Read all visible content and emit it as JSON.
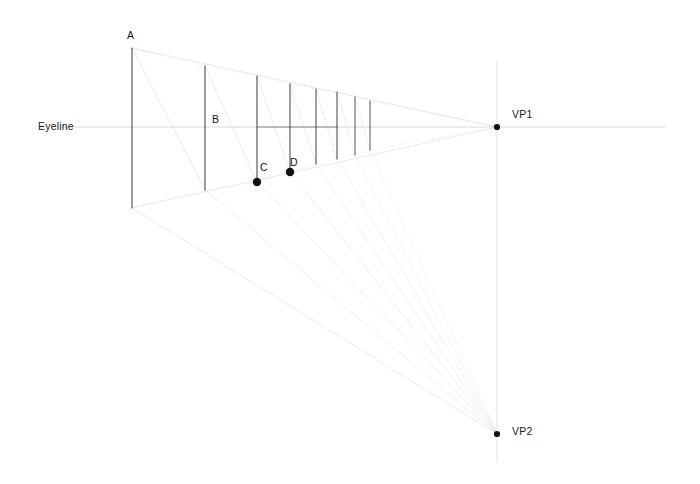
{
  "drawing": {
    "title": "Two-point perspective construction",
    "background_color": "#ffffff",
    "canvas": {
      "width": 700,
      "height": 484
    },
    "labels": {
      "eyeline": "Eyeline",
      "a": "A",
      "b": "B",
      "c": "C",
      "d": "D",
      "vp1": "VP1",
      "vp2": "VP2"
    },
    "colors": {
      "stroke_strong": "#3a3a3c",
      "stroke_dark": "#222225",
      "stroke_faint": "#c9c9cc",
      "stroke_very_faint": "#e0e0e3",
      "point_fill": "#101012",
      "text": "#16181a"
    },
    "label_positions": {
      "eyeline": {
        "x": 38,
        "y": 121
      },
      "a": {
        "x": 127,
        "y": 30
      },
      "b": {
        "x": 212,
        "y": 114
      },
      "c": {
        "x": 260,
        "y": 162
      },
      "d": {
        "x": 290,
        "y": 157
      },
      "vp1": {
        "x": 512,
        "y": 109
      },
      "vp2": {
        "x": 512,
        "y": 426
      }
    },
    "eyeline": {
      "x1": 62,
      "y1": 127,
      "x2": 665,
      "y2": 127
    },
    "vanishing_points": [
      {
        "name": "VP1",
        "x": 497,
        "y": 127,
        "radius": 3.1
      },
      {
        "name": "VP2",
        "x": 497,
        "y": 434,
        "radius": 3.1
      }
    ],
    "vertical_trace": {
      "x": 497,
      "y1": 60,
      "y2": 462
    },
    "verticals": [
      {
        "name": "A",
        "x": 132,
        "top": 48,
        "bottom": 208,
        "weight": 1.05
      },
      {
        "name": "B",
        "x": 205,
        "top": 66,
        "bottom": 190,
        "weight": 1.05
      },
      {
        "name": "C",
        "x": 257,
        "top": 76,
        "bottom": 182,
        "weight": 1.05
      },
      {
        "name": "D",
        "x": 290,
        "top": 84,
        "bottom": 172,
        "weight": 1.0
      },
      {
        "name": "E",
        "x": 316,
        "top": 89,
        "bottom": 164,
        "weight": 1.0
      },
      {
        "name": "F",
        "x": 337,
        "top": 92,
        "bottom": 159,
        "weight": 1.0
      },
      {
        "name": "G",
        "x": 355,
        "top": 97,
        "bottom": 155,
        "weight": 0.9
      },
      {
        "name": "H",
        "x": 370,
        "top": 101,
        "bottom": 150,
        "weight": 0.9
      }
    ],
    "ground_points": [
      {
        "name": "C",
        "x": 257,
        "y": 182,
        "radius": 4.2
      },
      {
        "name": "D",
        "x": 290,
        "y": 172,
        "radius": 4.2
      }
    ],
    "convergence_lines_vp1": [
      {
        "from_x": 132,
        "from_y": 48,
        "to_x": 497,
        "to_y": 127,
        "opacity": 0.55
      },
      {
        "from_x": 132,
        "from_y": 208,
        "to_x": 497,
        "to_y": 127,
        "opacity": 0.5
      }
    ],
    "convergence_lines_vp2": [
      {
        "from_x": 132,
        "from_y": 208,
        "to_x": 497,
        "to_y": 434,
        "opacity": 0.5
      },
      {
        "from_x": 205,
        "from_y": 190,
        "to_x": 497,
        "to_y": 434,
        "opacity": 0.42
      },
      {
        "from_x": 257,
        "from_y": 182,
        "to_x": 497,
        "to_y": 434,
        "opacity": 0.42
      },
      {
        "from_x": 290,
        "from_y": 172,
        "to_x": 497,
        "to_y": 434,
        "opacity": 0.4
      },
      {
        "from_x": 316,
        "from_y": 164,
        "to_x": 497,
        "to_y": 434,
        "opacity": 0.36
      },
      {
        "from_x": 337,
        "from_y": 159,
        "to_x": 497,
        "to_y": 434,
        "opacity": 0.34
      },
      {
        "from_x": 355,
        "from_y": 155,
        "to_x": 497,
        "to_y": 434,
        "opacity": 0.3
      },
      {
        "from_x": 370,
        "from_y": 150,
        "to_x": 497,
        "to_y": 434,
        "opacity": 0.28
      }
    ],
    "diagonal_segments": [
      {
        "x1": 132,
        "y1": 48,
        "x2": 205,
        "y2": 190,
        "opacity": 0.5
      },
      {
        "x1": 205,
        "y1": 66,
        "x2": 257,
        "y2": 182,
        "opacity": 0.45
      },
      {
        "x1": 257,
        "y1": 76,
        "x2": 290,
        "y2": 172,
        "opacity": 0.45
      },
      {
        "x1": 290,
        "y1": 84,
        "x2": 316,
        "y2": 164,
        "opacity": 0.42
      },
      {
        "x1": 316,
        "y1": 89,
        "x2": 337,
        "y2": 159,
        "opacity": 0.42
      },
      {
        "x1": 337,
        "y1": 92,
        "x2": 355,
        "y2": 155,
        "opacity": 0.38
      },
      {
        "x1": 355,
        "y1": 97,
        "x2": 370,
        "y2": 150,
        "opacity": 0.34
      }
    ],
    "top_chords": [
      {
        "x1": 132,
        "y1": 48,
        "x2": 205,
        "y2": 66,
        "opacity": 0.3
      },
      {
        "x1": 205,
        "y1": 66,
        "x2": 257,
        "y2": 76,
        "opacity": 0.3
      },
      {
        "x1": 257,
        "y1": 76,
        "x2": 290,
        "y2": 84,
        "opacity": 0.28
      },
      {
        "x1": 290,
        "y1": 84,
        "x2": 316,
        "y2": 89,
        "opacity": 0.28
      },
      {
        "x1": 316,
        "y1": 89,
        "x2": 337,
        "y2": 92,
        "opacity": 0.26
      },
      {
        "x1": 337,
        "y1": 92,
        "x2": 370,
        "y2": 101,
        "opacity": 0.26
      },
      {
        "x1": 370,
        "y1": 101,
        "x2": 497,
        "y2": 127,
        "opacity": 0.3
      }
    ],
    "bottom_chords": [
      {
        "x1": 132,
        "y1": 208,
        "x2": 205,
        "y2": 190,
        "opacity": 0.32
      },
      {
        "x1": 205,
        "y1": 190,
        "x2": 257,
        "y2": 182,
        "opacity": 0.3
      },
      {
        "x1": 257,
        "y1": 182,
        "x2": 290,
        "y2": 172,
        "opacity": 0.3
      },
      {
        "x1": 290,
        "y1": 172,
        "x2": 370,
        "y2": 150,
        "opacity": 0.28
      },
      {
        "x1": 370,
        "y1": 150,
        "x2": 497,
        "y2": 127,
        "opacity": 0.3
      }
    ],
    "eyeline_segments": [
      {
        "x1": 257,
        "y1": 127,
        "x2": 337,
        "y2": 127,
        "opacity": 0.75
      }
    ]
  }
}
